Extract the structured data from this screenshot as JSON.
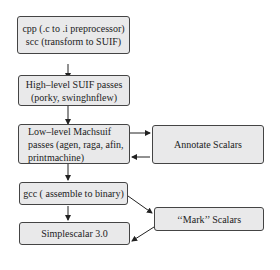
{
  "nodes": {
    "cpp": {
      "line1": "cpp (.c to .i preprocessor)",
      "line2": "scc (transform to SUIF)"
    },
    "high_level": {
      "line1": "High–level SUIF passes",
      "line2": "(porky, swinghnflew)"
    },
    "low_level": {
      "line1": "Low–level Machsuif",
      "line2": "passes (agen, raga, afin,",
      "line3": "printmachine)"
    },
    "gcc": {
      "label": "gcc ( assemble to binary)"
    },
    "simplescalar": {
      "label": "Simplescalar 3.0"
    },
    "annotate": {
      "label": "Annotate Scalars"
    },
    "mark": {
      "label": "‘‘Mark’’  Scalars"
    }
  },
  "colors": {
    "box_fill": "#e9e9ea",
    "border": "#444444"
  }
}
